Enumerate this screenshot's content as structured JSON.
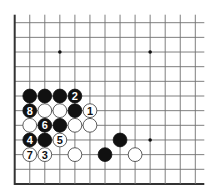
{
  "diagram": {
    "type": "go-board-partial",
    "columns": 13,
    "rows": 12,
    "origin_x": 14.7,
    "origin_y": 22.7,
    "spacing_x": 15.05,
    "spacing_y": 14.66,
    "edges": {
      "left": true,
      "bottom": true,
      "top": false,
      "right": false
    },
    "colors": {
      "line": "#707070",
      "edge": "#333333",
      "black": "#111111",
      "white": "#ffffff",
      "white_outline": "#333333",
      "star": "#111111"
    },
    "star_points": [
      {
        "col": 3,
        "row": 2
      },
      {
        "col": 9,
        "row": 2
      },
      {
        "col": 9,
        "row": 8
      }
    ],
    "stones": [
      {
        "col": 1,
        "row": 5,
        "color": "black",
        "label": ""
      },
      {
        "col": 2,
        "row": 5,
        "color": "black",
        "label": ""
      },
      {
        "col": 3,
        "row": 5,
        "color": "black",
        "label": ""
      },
      {
        "col": 4,
        "row": 5,
        "color": "black",
        "label": "2"
      },
      {
        "col": 1,
        "row": 6,
        "color": "black",
        "label": "8"
      },
      {
        "col": 2,
        "row": 6,
        "color": "white",
        "label": ""
      },
      {
        "col": 3,
        "row": 6,
        "color": "white",
        "label": ""
      },
      {
        "col": 4,
        "row": 6,
        "color": "black",
        "label": ""
      },
      {
        "col": 5,
        "row": 6,
        "color": "white",
        "label": "1"
      },
      {
        "col": 1,
        "row": 7,
        "color": "white",
        "label": ""
      },
      {
        "col": 2,
        "row": 7,
        "color": "black",
        "label": "6"
      },
      {
        "col": 3,
        "row": 7,
        "color": "black",
        "label": ""
      },
      {
        "col": 4,
        "row": 7,
        "color": "white",
        "label": ""
      },
      {
        "col": 5,
        "row": 7,
        "color": "white",
        "label": ""
      },
      {
        "col": 1,
        "row": 8,
        "color": "black",
        "label": "4"
      },
      {
        "col": 2,
        "row": 8,
        "color": "black",
        "label": ""
      },
      {
        "col": 3,
        "row": 8,
        "color": "white",
        "label": "5"
      },
      {
        "col": 7,
        "row": 8,
        "color": "black",
        "label": ""
      },
      {
        "col": 1,
        "row": 9,
        "color": "white",
        "label": "7"
      },
      {
        "col": 2,
        "row": 9,
        "color": "white",
        "label": "3"
      },
      {
        "col": 4,
        "row": 9,
        "color": "white",
        "label": ""
      },
      {
        "col": 6,
        "row": 9,
        "color": "black",
        "label": ""
      },
      {
        "col": 8,
        "row": 9,
        "color": "white",
        "label": ""
      }
    ]
  }
}
